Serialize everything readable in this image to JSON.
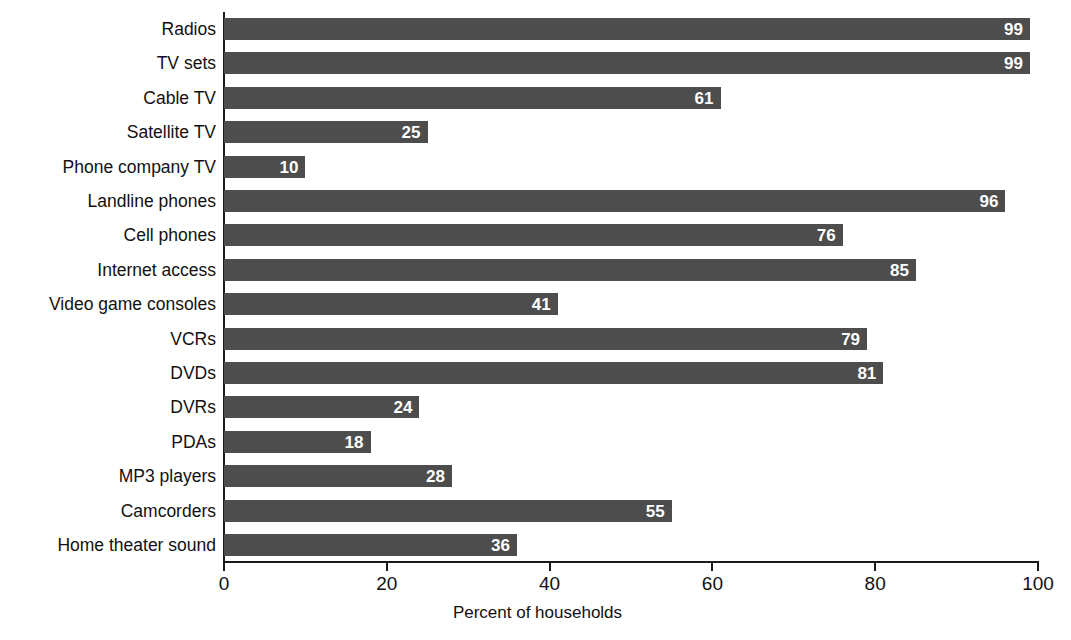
{
  "chart_data": {
    "type": "bar",
    "orientation": "horizontal",
    "title": "",
    "xlabel": "Percent of households",
    "ylabel": "",
    "xlim": [
      0,
      100
    ],
    "xticks": [
      0,
      20,
      40,
      60,
      80,
      100
    ],
    "grid": false,
    "legend": null,
    "bar_color": "#4d4d4d",
    "value_label_color": "#ffffff",
    "background_color": "#ffffff",
    "axis_color": "#1a1a1a",
    "categories": [
      "Radios",
      "TV sets",
      "Cable TV",
      "Satellite TV",
      "Phone company TV",
      "Landline phones",
      "Cell phones",
      "Internet access",
      "Video game consoles",
      "VCRs",
      "DVDs",
      "DVRs",
      "PDAs",
      "MP3 players",
      "Camcorders",
      "Home theater sound"
    ],
    "values": [
      99,
      99,
      61,
      25,
      10,
      96,
      76,
      85,
      41,
      79,
      81,
      24,
      18,
      28,
      55,
      36
    ],
    "data_labels": [
      "99",
      "99",
      "61",
      "25",
      "10",
      "96",
      "76",
      "85",
      "41",
      "79",
      "81",
      "24",
      "18",
      "28",
      "55",
      "36"
    ],
    "xtick_labels": [
      "0",
      "20",
      "40",
      "60",
      "80",
      "100"
    ]
  }
}
